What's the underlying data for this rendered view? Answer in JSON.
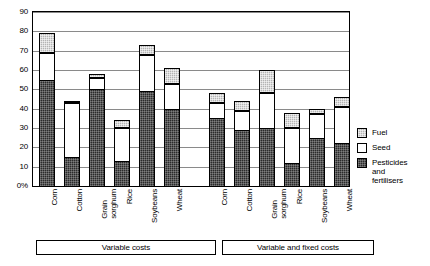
{
  "chart_data": {
    "type": "bar",
    "stacked": true,
    "title": "",
    "xlabel": "",
    "ylabel": "",
    "ylim": [
      0,
      90
    ],
    "ytick_labels": [
      "0%",
      "10",
      "20",
      "30",
      "40",
      "50",
      "60",
      "70",
      "80",
      "90"
    ],
    "ytick_values": [
      0,
      10,
      20,
      30,
      40,
      50,
      60,
      70,
      80,
      90
    ],
    "grid": true,
    "legend_position": "right",
    "series": [
      {
        "name": "Pesticides and fertilisers",
        "key": "pest",
        "color": "#2b2b2b",
        "values": [
          55,
          15,
          50,
          13,
          49,
          40,
          35,
          29,
          30,
          12,
          25,
          22
        ]
      },
      {
        "name": "Seed",
        "key": "seed",
        "color": "#ffffff",
        "values": [
          14,
          28,
          6,
          17,
          19,
          13,
          8,
          10,
          18,
          18,
          12,
          19
        ]
      },
      {
        "name": "Fuel",
        "key": "fuel",
        "color": "#b4b4b4",
        "values": [
          10,
          1,
          2,
          4,
          5,
          8,
          5,
          5,
          12,
          8,
          3,
          5
        ]
      }
    ],
    "categories": [
      "Corn",
      "Cotton",
      "Grain\nsorghum",
      "Rice",
      "Soybeans",
      "Wheat",
      "Corn",
      "Cotton",
      "Grain\nsorghum",
      "Rice",
      "Soybeans",
      "Wheat"
    ],
    "totals": [
      79,
      44,
      58,
      34,
      73,
      61,
      48,
      44,
      60,
      38,
      40,
      46
    ],
    "groups": [
      {
        "label": "Variable costs",
        "start": 0,
        "end": 5
      },
      {
        "label": "Variable and fixed costs",
        "start": 6,
        "end": 11
      }
    ]
  },
  "legend": {
    "items": [
      {
        "label": "Fuel",
        "key": "fuel"
      },
      {
        "label": "Seed",
        "key": "seed"
      },
      {
        "label": "Pesticides\nand\nfertilisers",
        "key": "pest"
      }
    ]
  }
}
